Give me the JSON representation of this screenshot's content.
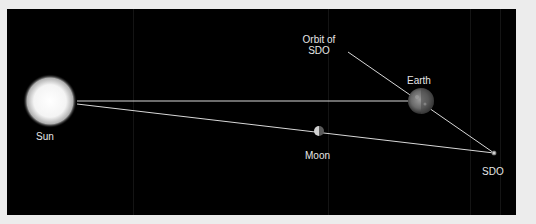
{
  "diagram": {
    "title": "",
    "background": "#000000",
    "frame_color": "#ececec",
    "line_color": "#d8d8d8",
    "bodies": [
      {
        "id": "sun",
        "label": "Sun",
        "cx": 50,
        "cy": 101,
        "r": 24
      },
      {
        "id": "earth",
        "label": "Earth",
        "cx": 421,
        "cy": 101,
        "r": 13
      },
      {
        "id": "moon",
        "label": "Moon",
        "cx": 318,
        "cy": 131,
        "r": 5
      },
      {
        "id": "sdo",
        "label": "SDO",
        "cx": 494,
        "cy": 153,
        "r": 2
      }
    ],
    "orbit_label": {
      "line1": "Orbit of",
      "line2": "SDO"
    },
    "lines": [
      {
        "name": "sun-earth-line",
        "from": [
          77,
          101
        ],
        "to": [
          408,
          101
        ]
      },
      {
        "name": "sun-sdo-line",
        "from": [
          77,
          104
        ],
        "to": [
          494,
          153
        ]
      },
      {
        "name": "orbit-of-sdo-line",
        "from": [
          348,
          52
        ],
        "to": [
          494,
          153
        ]
      }
    ]
  }
}
